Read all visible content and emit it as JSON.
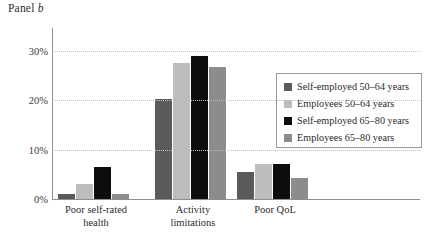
{
  "title": {
    "prefix": "Panel ",
    "letter": "b",
    "full": "Panel b"
  },
  "chart_data": {
    "type": "bar",
    "title": "Panel b",
    "xlabel": "",
    "ylabel": "",
    "ylim": [
      0,
      32
    ],
    "yticks": [
      "0%",
      "10%",
      "20%",
      "30%"
    ],
    "ytick_values": [
      0,
      10,
      20,
      30
    ],
    "grid": true,
    "grid_style": "dotted horizontal",
    "legend_position": "right",
    "categories": [
      "Poor self-rated\nhealth",
      "Activity\nlimitations",
      "Poor QoL"
    ],
    "category_labels_flat": [
      "Poor self-rated health",
      "Activity limitations",
      "Poor QoL"
    ],
    "series": [
      {
        "name": "Self-employed 50–64 years",
        "color": "#5a5a5a",
        "values": [
          1.0,
          20.3,
          5.5
        ]
      },
      {
        "name": "Employees 50–64 years",
        "color": "#bdbdbd",
        "values": [
          3.0,
          27.5,
          7.0
        ]
      },
      {
        "name": "Self-employed 65–80 years",
        "color": "#0d0d0d",
        "values": [
          6.5,
          29.0,
          7.0
        ]
      },
      {
        "name": "Employees 65–80 years",
        "color": "#8c8c8c",
        "values": [
          1.0,
          26.7,
          4.3
        ]
      }
    ]
  },
  "colors": {
    "axis": "#8e8e8e",
    "grid": "#c2c2c2",
    "text": "#2b2b2b",
    "legend_border": "#9a9a9a",
    "background": "#ffffff"
  }
}
